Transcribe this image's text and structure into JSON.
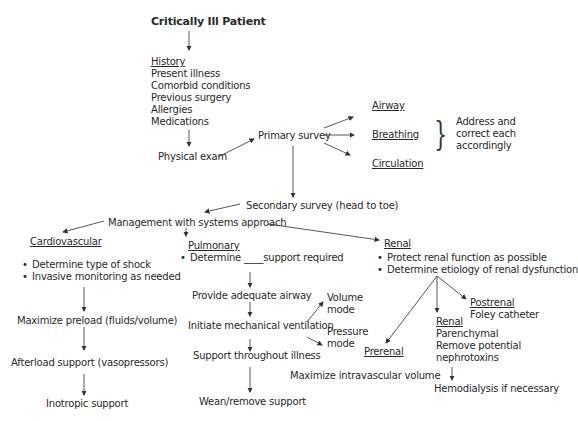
{
  "title": "Critically Ill Patient",
  "history": {
    "heading": "History",
    "items": [
      "Present illness",
      "Comorbid conditions",
      "Previous surgery",
      "Allergies",
      "Medications"
    ]
  },
  "physical_exam": "Physical exam",
  "primary_survey": {
    "label": "Primary survey",
    "items": [
      "Airway",
      "Breathing",
      "Circulation"
    ],
    "note": [
      "Address and",
      "correct each",
      "accordingly"
    ]
  },
  "secondary_survey": "Secondary survey (head to toe)",
  "management": "Management with systems approach",
  "cardiovascular": {
    "heading": "Cardiovascular",
    "bullets": [
      "Determine type of shock",
      "Invasive monitoring as needed"
    ],
    "steps": [
      "Maximize preload (fluids/volume)",
      "Afterload support (vasopressors)",
      "Inotropic support"
    ]
  },
  "pulmonary": {
    "heading": "Pulmonary",
    "bullet": "Determine ____support required",
    "steps": [
      "Provide adequate airway",
      "Initiate mechanical ventilation",
      "Support throughout illness",
      "Wean/remove support"
    ],
    "modes": [
      [
        "Volume",
        "mode"
      ],
      [
        "Pressure",
        "mode"
      ]
    ]
  },
  "renal": {
    "heading": "Renal",
    "bullets": [
      "Protect renal function as possible",
      "Determine etiology of renal dysfunction"
    ],
    "prerenal": {
      "heading": "Prerenal",
      "action": "Maximize intravascular volume"
    },
    "intrinsic": {
      "heading": "Renal",
      "lines": [
        "Parenchymal",
        "Remove potential",
        "nephrotoxins"
      ],
      "next": "Hemodialysis if necessary"
    },
    "postrenal": {
      "heading": "Postrenal",
      "action": "Foley catheter"
    }
  }
}
